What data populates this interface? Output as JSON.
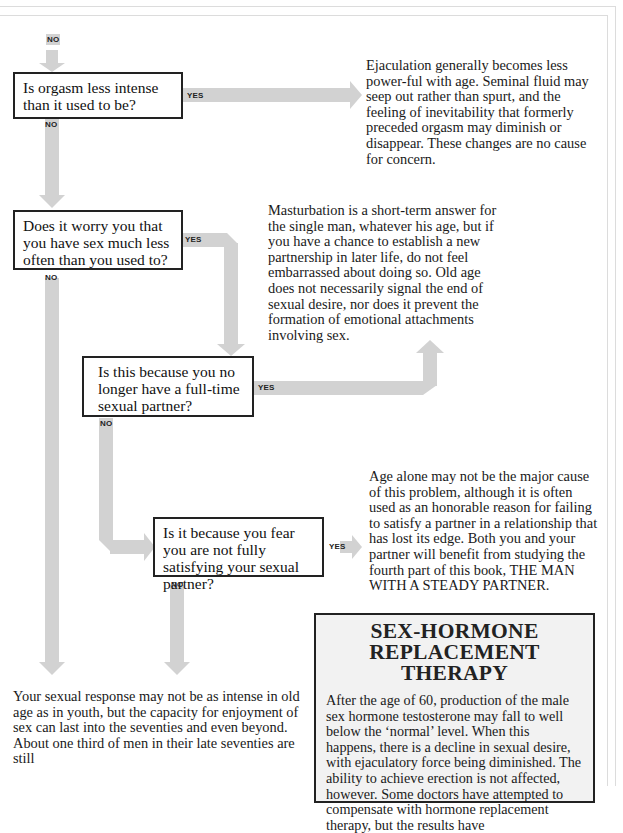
{
  "colors": {
    "arrow": "#d2d2d2",
    "box_border": "#222222",
    "sidebar_bg": "#f2f2f2",
    "frame": "#dcdcdc"
  },
  "flowchart": {
    "entry_label": "NO",
    "questions": [
      {
        "id": "q1",
        "text": "Is orgasm less intense than it used to be?",
        "yes_label": "YES",
        "no_label": "NO"
      },
      {
        "id": "q2",
        "text": "Does it worry you that you have sex much less often than you used to?",
        "yes_label": "YES",
        "no_label": "NO"
      },
      {
        "id": "q3",
        "text": "Is this because you no longer have a full-time sexual partner?",
        "yes_label": "YES",
        "no_label": "NO"
      },
      {
        "id": "q4",
        "text": "Is it because you fear you are not fully satisfying your sexual partner?",
        "yes_label": "YES",
        "no_label": "NO"
      }
    ],
    "answers": [
      {
        "id": "a1",
        "text": "Ejaculation generally becomes less power-ful with age. Seminal fluid may seep out rather than spurt, and the feeling of inevitability that formerly preceded orgasm may diminish or disappear. These changes are no cause for concern."
      },
      {
        "id": "a2",
        "text": "Masturbation is a short-term answer for the single man, whatever his age, but if you have a chance to establish a new partnership in later life, do not feel embarrassed about doing so. Old age does not necessarily signal the end of sexual desire, nor does it prevent the formation of emotional attachments involving sex."
      },
      {
        "id": "a3",
        "text": "Age alone may not be the major cause of this problem, although it is often used as an honorable reason for failing to satisfy a partner in a relationship that has lost its edge. Both you and your partner will benefit from studying the fourth part of this book, THE MAN WITH A STEADY PARTNER."
      },
      {
        "id": "a4",
        "text": "Your sexual response may not be as intense in old age as in youth, but the capacity for enjoyment of sex can last into the seventies and even beyond. About one third of men in their late seventies are still"
      }
    ]
  },
  "sidebar": {
    "title_line1": "SEX-HORMONE",
    "title_line2": "REPLACEMENT THERAPY",
    "body": "After the age of 60, production of the male sex hormone testosterone may fall to well below the ‘normal’ level. When this happens, there is a decline in sexual desire, with ejaculatory force being diminished. The ability to achieve erection is not affected, however. Some doctors have attempted to compensate with hormone replacement therapy, but the results have"
  }
}
